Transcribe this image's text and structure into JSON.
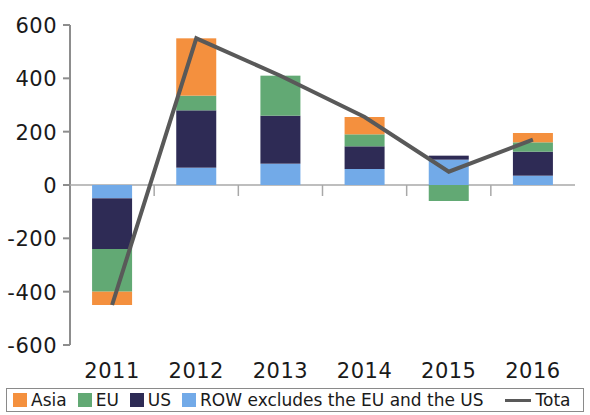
{
  "chart_data": {
    "type": "bar",
    "title": "",
    "subtitle": "",
    "xlabel": "",
    "ylabel": "",
    "categories": [
      "2011",
      "2012",
      "2013",
      "2014",
      "2015",
      "2016"
    ],
    "ylim": [
      -600,
      600
    ],
    "yticks": [
      "600",
      "400",
      "200",
      "0",
      "-200",
      "-400",
      "-600"
    ],
    "ytick_values": [
      600,
      400,
      200,
      0,
      -200,
      -400,
      -600
    ],
    "grid": false,
    "stacked": true,
    "legend_position": "bottom",
    "series": [
      {
        "name": "Asia",
        "color": "#F4903E",
        "values": [
          -50,
          215,
          0,
          65,
          0,
          35
        ]
      },
      {
        "name": "EU",
        "color": "#62A974",
        "values": [
          -160,
          55,
          150,
          45,
          -60,
          35
        ]
      },
      {
        "name": "US",
        "color": "#2E2B55",
        "values": [
          -190,
          215,
          180,
          85,
          15,
          90
        ]
      },
      {
        "name": "ROW excludes the EU and the US",
        "color": "#72AAE8",
        "values": [
          -50,
          65,
          80,
          60,
          95,
          35
        ]
      }
    ],
    "line_series": {
      "name": "Total",
      "label_truncated": "Tota",
      "color": "#595959",
      "values": [
        -450,
        550,
        410,
        255,
        50,
        170
      ]
    }
  },
  "legend": {
    "items": [
      {
        "label": "Asia",
        "color": "#F4903E",
        "type": "swatch"
      },
      {
        "label": "EU",
        "color": "#62A974",
        "type": "swatch"
      },
      {
        "label": "US",
        "color": "#2E2B55",
        "type": "swatch"
      },
      {
        "label": "ROW excludes the EU and the US",
        "color": "#72AAE8",
        "type": "swatch"
      },
      {
        "label": "Tota",
        "color": "#595959",
        "type": "line"
      }
    ]
  }
}
